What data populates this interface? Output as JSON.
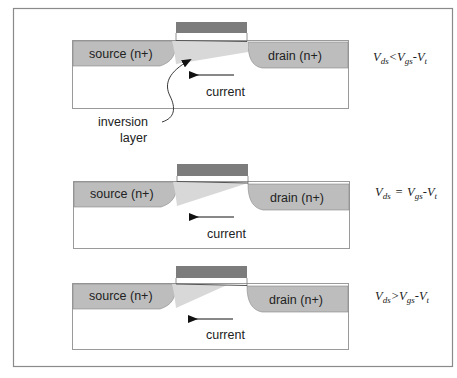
{
  "colors": {
    "frame": "#8a8a8a",
    "substrate_fill": "#ffffff",
    "substrate_stroke": "#9a9a9a",
    "doped_region": "#bdbdbd",
    "channel": "#d6d6d6",
    "gate": "#7c7c7c",
    "text": "#222222"
  },
  "panels": [
    {
      "source_label": "source (n+)",
      "drain_label": "drain (n+)",
      "current_label": "current",
      "equation": {
        "v1": "V",
        "s1": "ds",
        "op": "<",
        "v2": "V",
        "s2": "gs",
        "minus": "-",
        "v3": "V",
        "s3": "t"
      },
      "annotation": {
        "line1": "inversion",
        "line2": "layer"
      }
    },
    {
      "source_label": "source (n+)",
      "drain_label": "drain (n+)",
      "current_label": "current",
      "equation": {
        "v1": "V",
        "s1": "ds",
        "op": "=",
        "v2": "V",
        "s2": "gs",
        "minus": "-",
        "v3": "V",
        "s3": "t"
      }
    },
    {
      "source_label": "source (n+)",
      "drain_label": "drain (n+)",
      "current_label": "current",
      "equation": {
        "v1": "V",
        "s1": "ds",
        "op": ">",
        "v2": "V",
        "s2": "gs",
        "minus": "-",
        "v3": "V",
        "s3": "t"
      }
    }
  ]
}
